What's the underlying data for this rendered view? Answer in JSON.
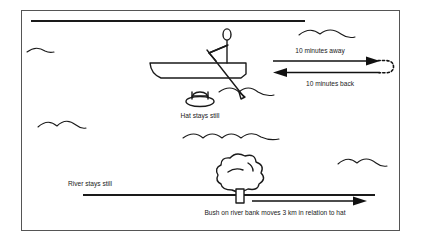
{
  "diagram": {
    "frame": {
      "border_color": "#555555",
      "background": "#ffffff"
    },
    "ink_color": "#1a1a1a",
    "labels": {
      "away": "10 minutes away",
      "back": "10 minutes back",
      "hat": "Hat stays still",
      "river": "River stays still",
      "bush": "Bush on river bank moves 3 km in relation to hat"
    },
    "icons": {
      "boat": "rowboat-icon",
      "rower": "rower-figure-icon",
      "hat": "floating-hat-icon",
      "bush": "bush-tree-icon",
      "wave": "water-wave-icon",
      "arrow_right": "arrow-right-icon",
      "arrow_left": "arrow-left-icon",
      "turn": "dashed-u-turn-icon"
    },
    "measurements": {
      "away_minutes": "10",
      "back_minutes": "10",
      "bush_distance_km": "3"
    }
  }
}
